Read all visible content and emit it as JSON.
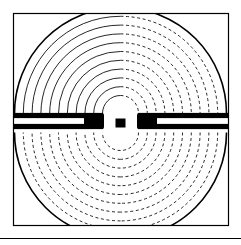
{
  "figure": {
    "title": "Electrostatic field map of a bow-tie dipole electrode pair",
    "type": "field-line-diagram",
    "background_color": "#ffffff",
    "ink_color": "#000000",
    "canvas": {
      "width": 241,
      "height": 245
    }
  },
  "frame": {
    "name": "plot-border",
    "x": 13.5,
    "y": 13.5,
    "width": 215,
    "height": 212,
    "stroke_color": "#000000",
    "stroke_width": 1.2,
    "fill": "none"
  },
  "baseline_rule": {
    "name": "bottom-rule",
    "y": 238.5,
    "x_start": 0,
    "x_end": 241,
    "stroke_color": "#000000",
    "stroke_width": 1.1
  },
  "center": {
    "x": 120.5,
    "y": 123
  },
  "electrodes": {
    "color": "#000000",
    "gap_label": "central spark gap",
    "left": {
      "name": "left-electrode",
      "bar_x_start": 14,
      "bar_x_end": 103,
      "upper_bar_y": 115.5,
      "lower_bar_y": 126.5,
      "bar_thickness": 5.2,
      "tip_x": 103,
      "blob_x_start": 84,
      "blob_x_end": 104
    },
    "right": {
      "name": "right-electrode",
      "bar_x_start": 138,
      "bar_x_end": 228,
      "upper_bar_y": 115.5,
      "lower_bar_y": 126.5,
      "bar_thickness": 5.2,
      "tip_x": 138,
      "blob_x_start": 137,
      "blob_x_end": 157
    },
    "center_stub": {
      "name": "center-stub",
      "x": 115.5,
      "y": 118.5,
      "width": 10,
      "height": 9
    }
  },
  "quadrants": [
    {
      "name": "upper-left-quadrant",
      "label": "Q2",
      "line_style": "solid",
      "arc_center_x": 120.5,
      "arc_center_y": 113.5,
      "angle_start_deg": 180,
      "angle_end_deg": 270,
      "outer_radius": 106,
      "arc_count": 11,
      "inner_radius": 18,
      "stroke_width": 0.85,
      "boundary_arc": true
    },
    {
      "name": "upper-right-quadrant",
      "label": "Q1",
      "line_style": "dashed",
      "arc_center_x": 120.5,
      "arc_center_y": 113.5,
      "angle_start_deg": 270,
      "angle_end_deg": 360,
      "outer_radius": 106,
      "arc_count": 11,
      "inner_radius": 18,
      "stroke_width": 0.85,
      "dash_pattern": "3 2.6",
      "boundary_arc": true
    },
    {
      "name": "lower-left-quadrant",
      "label": "Q3",
      "line_style": "dashed",
      "arc_center_x": 120.5,
      "arc_center_y": 132.5,
      "angle_start_deg": 90,
      "angle_end_deg": 180,
      "outer_radius": 106,
      "arc_count": 11,
      "inner_radius": 18,
      "stroke_width": 0.85,
      "dash_pattern": "3 2.6",
      "boundary_arc": true
    },
    {
      "name": "lower-right-quadrant",
      "label": "Q4",
      "line_style": "dashed",
      "arc_center_x": 120.5,
      "arc_center_y": 132.5,
      "angle_start_deg": 0,
      "angle_end_deg": 90,
      "outer_radius": 106,
      "arc_count": 11,
      "inner_radius": 18,
      "stroke_width": 0.85,
      "dash_pattern": "3 2.6",
      "boundary_arc": true
    }
  ]
}
